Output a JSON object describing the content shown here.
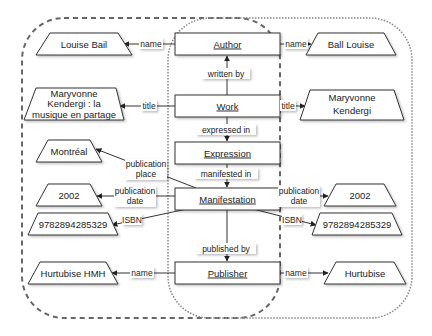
{
  "diagram": {
    "containers": [
      {
        "id": "left-group",
        "style": "dashed",
        "x": 22,
        "y": 18,
        "w": 258,
        "h": 300,
        "rx": 42
      },
      {
        "id": "right-group",
        "style": "dotted",
        "x": 168,
        "y": 18,
        "w": 244,
        "h": 300,
        "rx": 42
      }
    ],
    "entities": [
      {
        "id": "author",
        "label": "Author",
        "x": 175,
        "y": 33,
        "w": 105,
        "h": 22
      },
      {
        "id": "work",
        "label": "Work",
        "x": 175,
        "y": 95,
        "w": 105,
        "h": 22
      },
      {
        "id": "expression",
        "label": "Expression",
        "x": 175,
        "y": 142,
        "w": 105,
        "h": 22
      },
      {
        "id": "manifestation",
        "label": "Manifestation",
        "x": 175,
        "y": 188,
        "w": 105,
        "h": 22
      },
      {
        "id": "publisher",
        "label": "Publisher",
        "x": 175,
        "y": 262,
        "w": 105,
        "h": 22
      }
    ],
    "literals_left": [
      {
        "id": "louise-bail",
        "lines": [
          "Louise Bail"
        ],
        "x": 36,
        "y": 33,
        "w": 96,
        "h": 22
      },
      {
        "id": "maryvonne-left",
        "lines": [
          "Maryvonne",
          "Kendergi : la",
          "musique en partage"
        ],
        "x": 24,
        "y": 88,
        "w": 100,
        "h": 32
      },
      {
        "id": "montreal",
        "lines": [
          "Montréal"
        ],
        "x": 36,
        "y": 140,
        "w": 66,
        "h": 22
      },
      {
        "id": "date-left",
        "lines": [
          "2002"
        ],
        "x": 36,
        "y": 184,
        "w": 66,
        "h": 22
      },
      {
        "id": "isbn-left",
        "lines": [
          "9782894285329"
        ],
        "x": 28,
        "y": 213,
        "w": 90,
        "h": 22
      },
      {
        "id": "hurtubise-hmh",
        "lines": [
          "Hurtubise HMH"
        ],
        "x": 28,
        "y": 262,
        "w": 90,
        "h": 22
      }
    ],
    "literals_right": [
      {
        "id": "ball-louise",
        "lines": [
          "Ball Louise"
        ],
        "x": 306,
        "y": 33,
        "w": 90,
        "h": 22
      },
      {
        "id": "maryvonne-right",
        "lines": [
          "Maryvonne",
          "Kendergi"
        ],
        "x": 300,
        "y": 90,
        "w": 104,
        "h": 30
      },
      {
        "id": "date-right",
        "lines": [
          "2002"
        ],
        "x": 324,
        "y": 184,
        "w": 72,
        "h": 22
      },
      {
        "id": "isbn-right",
        "lines": [
          "9782894285329"
        ],
        "x": 312,
        "y": 213,
        "w": 90,
        "h": 22
      },
      {
        "id": "hurtubise",
        "lines": [
          "Hurtubise"
        ],
        "x": 324,
        "y": 262,
        "w": 82,
        "h": 22
      }
    ],
    "edge_labels": {
      "author_name_left": "name",
      "author_name_right": "name",
      "written_by": "written by",
      "work_title_left": "title",
      "work_title_right": "title",
      "expressed_in": "expressed in",
      "manifested_in": "manifested in",
      "publication_place": [
        "publication",
        "place"
      ],
      "publication_date_left": [
        "publication",
        "date"
      ],
      "publication_date_right": [
        "publication",
        "date"
      ],
      "isbn_left": "ISBN",
      "isbn_right": "ISBN",
      "published_by": "published by",
      "publisher_name_left": "name",
      "publisher_name_right": "name"
    },
    "colors": {
      "stroke": "#333333",
      "container_stroke": "#666666",
      "fill": "#ffffff",
      "text": "#222222"
    }
  }
}
